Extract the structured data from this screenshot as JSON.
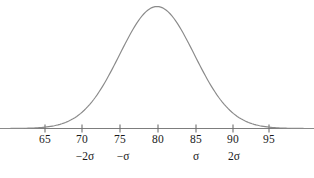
{
  "figure": {
    "kind": "normal-distribution-curve",
    "background_color": "#ffffff",
    "curve_color": "#8a8a8a",
    "axis_color": "#7d7d7d",
    "text_color": "#1a1a1a"
  },
  "chart_data": {
    "type": "line",
    "title": "",
    "subtitle": "",
    "xlabel": "",
    "ylabel": "",
    "grid": false,
    "legend": "none",
    "distribution": {
      "name": "normal",
      "mean": 80,
      "std_dev": 5,
      "peak_x": 80
    },
    "xlim": [
      61,
      101
    ],
    "ylim": [
      0,
      1
    ],
    "axis": {
      "ticks": [
        65,
        70,
        75,
        80,
        85,
        90,
        95
      ],
      "tick_labels": [
        "65",
        "70",
        "75",
        "80",
        "85",
        "90",
        "95"
      ]
    },
    "sigma_annotations": [
      {
        "x": 70,
        "label": "−2σ"
      },
      {
        "x": 75,
        "label": "−σ"
      },
      {
        "x": 85,
        "label": "σ"
      },
      {
        "x": 90,
        "label": "2σ"
      }
    ],
    "x": [
      61,
      62,
      63,
      64,
      65,
      66,
      67,
      68,
      69,
      70,
      71,
      72,
      73,
      74,
      75,
      76,
      77,
      78,
      79,
      80,
      81,
      82,
      83,
      84,
      85,
      86,
      87,
      88,
      89,
      90,
      91,
      92,
      93,
      94,
      95,
      96,
      97,
      98,
      99,
      100,
      101
    ],
    "y": [
      0.0003,
      0.0007,
      0.0015,
      0.0031,
      0.0063,
      0.0123,
      0.0228,
      0.0404,
      0.0685,
      0.1111,
      0.1723,
      0.2555,
      0.3624,
      0.4923,
      0.64,
      0.7977,
      0.9512,
      1.0,
      1.0,
      1.0,
      1.0,
      1.0,
      0.9512,
      0.7977,
      0.64,
      0.4923,
      0.3624,
      0.2555,
      0.1723,
      0.1111,
      0.0685,
      0.0404,
      0.0228,
      0.0123,
      0.0063,
      0.0031,
      0.0015,
      0.0007,
      0.0003,
      0.0001,
      0.0
    ],
    "note": "y values are the normalized normal density exp(-(x-80)^2/(2*5^2)), peak = 1.0 at x = 80"
  }
}
